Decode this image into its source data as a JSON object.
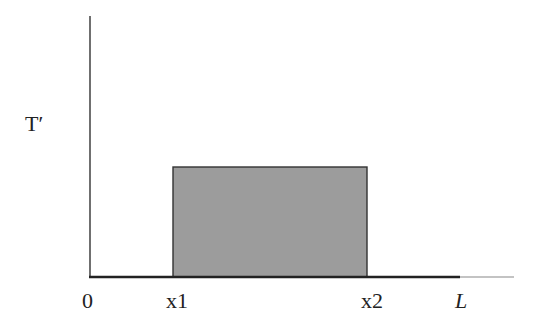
{
  "diagram": {
    "y_axis_label": "T′",
    "x_tick_labels": {
      "origin": "0",
      "x1": "x1",
      "x2": "x2",
      "end": "L"
    },
    "shape": "rectangular pulse",
    "colors": {
      "pulse_fill": "#9c9c9c",
      "axis": "#333333",
      "baseline_extension": "#888888"
    }
  }
}
